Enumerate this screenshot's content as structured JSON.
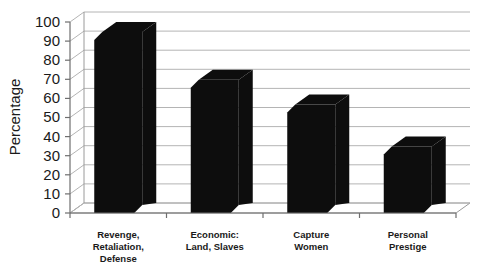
{
  "chart_data": {
    "type": "bar",
    "title": "",
    "subtitle": "",
    "xlabel": "",
    "ylabel": "Percentage",
    "ylim": [
      0,
      100
    ],
    "ytick_step": 10,
    "yticks": [
      0,
      10,
      20,
      30,
      40,
      50,
      60,
      70,
      80,
      90,
      100
    ],
    "grid": true,
    "legend": false,
    "legend_position": "none",
    "style": "3d-column",
    "categories": [
      "Revenge, Retaliation, Defense",
      "Economic: Land, Slaves",
      "Capture Women",
      "Personal Prestige"
    ],
    "category_lines": [
      [
        "Revenge,",
        "Retaliation,",
        "Defense"
      ],
      [
        "Economic:",
        "Land, Slaves"
      ],
      [
        "Capture",
        "Women"
      ],
      [
        "Personal",
        "Prestige"
      ]
    ],
    "values": [
      100,
      75,
      62,
      40
    ],
    "series": [
      {
        "name": "Percentage",
        "values": [
          100,
          75,
          62,
          40
        ]
      }
    ],
    "bar_color": "#0d0d0d",
    "grid_color": "#b4b4b4",
    "axis_color": "#6e6e6e",
    "background_color": "#ffffff"
  },
  "axis": {
    "y_title": "Percentage",
    "y_tick_labels": [
      "100",
      "90",
      "80",
      "70",
      "60",
      "50",
      "40",
      "30",
      "20",
      "10",
      "0"
    ]
  },
  "categories": {
    "items": [
      {
        "line1": "Revenge,",
        "line2": "Retaliation,",
        "line3": "Defense"
      },
      {
        "line1": "Economic:",
        "line2": "Land, Slaves",
        "line3": ""
      },
      {
        "line1": "Capture",
        "line2": "Women",
        "line3": ""
      },
      {
        "line1": "Personal",
        "line2": "Prestige",
        "line3": ""
      }
    ]
  }
}
